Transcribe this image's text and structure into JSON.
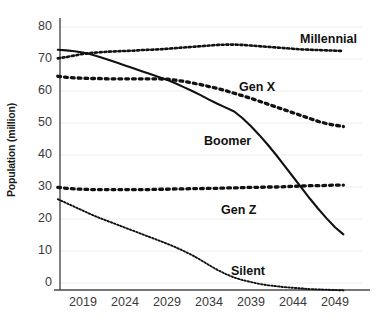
{
  "chart_data": {
    "type": "line",
    "title": "",
    "xlabel": "",
    "ylabel": "Population (million)",
    "xlim": [
      2016,
      2051
    ],
    "ylim": [
      -3,
      84
    ],
    "grid": true,
    "grid_axis": "y",
    "legend": "inline-annotations",
    "x_ticks": [
      "2019",
      "2024",
      "2029",
      "2034",
      "2039",
      "2044",
      "2049"
    ],
    "x_tick_values": [
      2019,
      2024,
      2029,
      2034,
      2039,
      2044,
      2049
    ],
    "y_ticks": [
      "0",
      "10",
      "20",
      "30",
      "40",
      "50",
      "60",
      "70",
      "80"
    ],
    "y_tick_values": [
      0,
      10,
      20,
      30,
      40,
      50,
      60,
      70,
      80
    ],
    "x": [
      2016,
      2017,
      2018,
      2019,
      2020,
      2021,
      2022,
      2023,
      2024,
      2025,
      2026,
      2027,
      2028,
      2029,
      2030,
      2031,
      2032,
      2033,
      2034,
      2035,
      2036,
      2037,
      2038,
      2039,
      2040,
      2041,
      2042,
      2043,
      2044,
      2045,
      2046,
      2047,
      2048,
      2049,
      2050
    ],
    "series": [
      {
        "name": "Millennial",
        "style": "dotted",
        "color": "#111111",
        "values": [
          70.2,
          70.6,
          71.1,
          71.6,
          71.9,
          72.1,
          72.3,
          72.4,
          72.5,
          72.6,
          72.8,
          72.9,
          73.0,
          73.2,
          73.4,
          73.6,
          73.8,
          74.0,
          74.2,
          74.4,
          74.5,
          74.5,
          74.4,
          74.2,
          74.0,
          73.8,
          73.6,
          73.4,
          73.2,
          73.0,
          72.9,
          72.8,
          72.7,
          72.6,
          72.5
        ]
      },
      {
        "name": "Boomer",
        "style": "solid",
        "color": "#111111",
        "values": [
          72.9,
          72.7,
          72.4,
          72.0,
          71.4,
          70.6,
          69.8,
          68.9,
          68.0,
          67.1,
          66.2,
          65.3,
          64.4,
          63.5,
          62.4,
          61.2,
          60.0,
          58.7,
          57.3,
          56.0,
          54.8,
          53.6,
          51.5,
          49.0,
          46.2,
          43.2,
          40.0,
          36.6,
          33.2,
          29.8,
          26.4,
          23.2,
          20.2,
          17.4,
          15.2
        ]
      },
      {
        "name": "Gen X",
        "style": "dotted-large",
        "color": "#111111",
        "values": [
          64.6,
          64.3,
          64.1,
          64.0,
          63.9,
          63.9,
          63.8,
          63.8,
          63.8,
          63.8,
          63.8,
          63.8,
          63.8,
          63.7,
          63.4,
          63.0,
          62.5,
          62.0,
          61.4,
          60.8,
          60.1,
          59.3,
          58.5,
          57.7,
          56.8,
          55.9,
          55.0,
          54.1,
          53.2,
          52.3,
          51.4,
          50.5,
          49.8,
          49.3,
          48.9
        ]
      },
      {
        "name": "Gen Z",
        "style": "dotted-large",
        "color": "#111111",
        "values": [
          29.9,
          29.6,
          29.4,
          29.3,
          29.2,
          29.2,
          29.2,
          29.2,
          29.2,
          29.2,
          29.2,
          29.2,
          29.3,
          29.3,
          29.4,
          29.4,
          29.5,
          29.5,
          29.6,
          29.6,
          29.7,
          29.7,
          29.8,
          29.9,
          29.9,
          30.0,
          30.0,
          30.1,
          30.2,
          30.3,
          30.4,
          30.4,
          30.5,
          30.6,
          30.6
        ]
      },
      {
        "name": "Silent",
        "style": "dotted-fine",
        "color": "#111111",
        "values": [
          26.2,
          25.0,
          23.8,
          22.6,
          21.4,
          20.3,
          19.3,
          18.3,
          17.3,
          16.3,
          15.3,
          14.3,
          13.3,
          12.3,
          11.2,
          10.0,
          8.7,
          7.2,
          5.6,
          4.1,
          2.8,
          1.7,
          0.9,
          0.3,
          -0.3,
          -0.7,
          -1.0,
          -1.3,
          -1.5,
          -1.7,
          -1.9,
          -2.0,
          -2.1,
          -2.2,
          -2.3
        ]
      }
    ],
    "annotations": [
      {
        "text": "Millennial",
        "x_px": 300,
        "y_px": 32
      },
      {
        "text": "Gen X",
        "x_px": 239,
        "y_px": 80
      },
      {
        "text": "Boomer",
        "x_px": 204,
        "y_px": 134
      },
      {
        "text": "Gen Z",
        "x_px": 221,
        "y_px": 203
      },
      {
        "text": "Silent",
        "x_px": 231,
        "y_px": 264
      }
    ]
  },
  "axes": {
    "y_axis_label": "Population (million)"
  }
}
